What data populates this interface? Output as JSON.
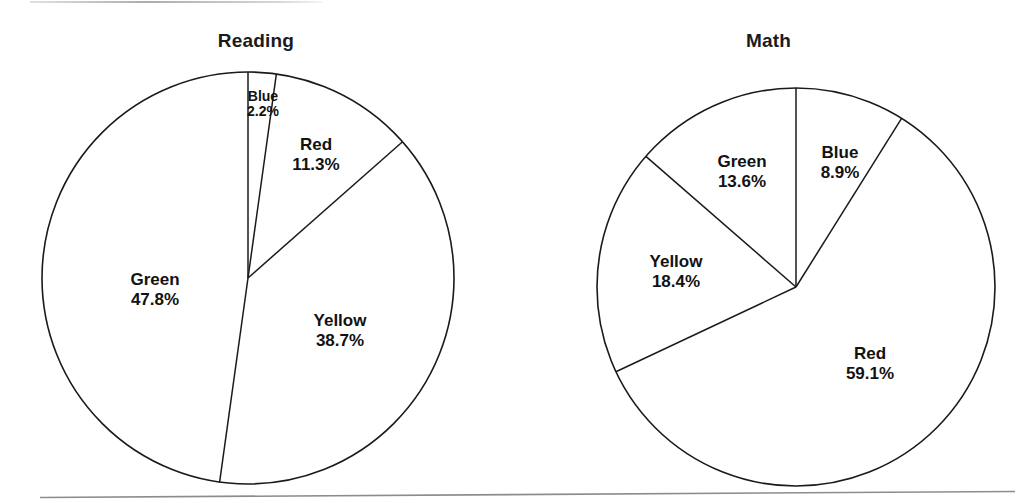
{
  "page": {
    "background": "#ffffff",
    "line_color": "#1a1a1a",
    "text_color": "#121212"
  },
  "chart_data": [
    {
      "type": "pie",
      "title": "Reading",
      "center": [
        248,
        278
      ],
      "radius": 206,
      "start_angle_deg": 0,
      "direction": "clockwise",
      "categories": [
        "Blue",
        "Red",
        "Yellow",
        "Green"
      ],
      "values": [
        2.2,
        11.3,
        38.7,
        47.8
      ],
      "value_suffix": "%",
      "slices": [
        {
          "label": "Blue",
          "pct": "2.2%",
          "value": 2.2,
          "label_x": 263,
          "label_y": 104,
          "size": "small"
        },
        {
          "label": "Red",
          "pct": "11.3%",
          "value": 11.3,
          "label_x": 316,
          "label_y": 155,
          "size": "normal"
        },
        {
          "label": "Yellow",
          "pct": "38.7%",
          "value": 38.7,
          "label_x": 340,
          "label_y": 331,
          "size": "normal"
        },
        {
          "label": "Green",
          "pct": "47.8%",
          "value": 47.8,
          "label_x": 155,
          "label_y": 290,
          "size": "normal"
        }
      ],
      "legend": "none",
      "grid": false
    },
    {
      "type": "pie",
      "title": "Math",
      "center": [
        796,
        287
      ],
      "radius": 199,
      "start_angle_deg": 0,
      "direction": "clockwise",
      "categories": [
        "Blue",
        "Red",
        "Yellow",
        "Green"
      ],
      "values": [
        8.9,
        59.1,
        18.4,
        13.6
      ],
      "value_suffix": "%",
      "slices": [
        {
          "label": "Blue",
          "pct": "8.9%",
          "value": 8.9,
          "label_x": 840,
          "label_y": 163,
          "size": "normal"
        },
        {
          "label": "Red",
          "pct": "59.1%",
          "value": 59.1,
          "label_x": 870,
          "label_y": 364,
          "size": "normal"
        },
        {
          "label": "Yellow",
          "pct": "18.4%",
          "value": 18.4,
          "label_x": 676,
          "label_y": 272,
          "size": "normal"
        },
        {
          "label": "Green",
          "pct": "13.6%",
          "value": 13.6,
          "label_x": 742,
          "label_y": 172,
          "size": "normal"
        }
      ],
      "legend": "none",
      "grid": false
    }
  ]
}
